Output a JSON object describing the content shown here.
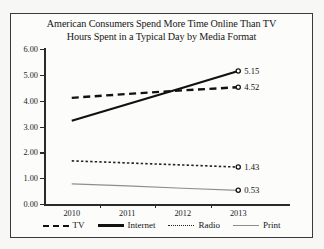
{
  "chart_data": {
    "type": "line",
    "title": "American Consumers Spend More Time Online Than TV",
    "subtitle": "Hours Spent in a Typical Day by Media Format",
    "xlabel": "",
    "ylabel": "",
    "categories": [
      "2010",
      "2011",
      "2012",
      "2013"
    ],
    "ylim": [
      0.0,
      6.0
    ],
    "ytick_labels": [
      "0.00",
      "1.00",
      "2.00",
      "3.00",
      "4.00",
      "5.00",
      "6.00"
    ],
    "ytick_values": [
      0.0,
      1.0,
      2.0,
      3.0,
      4.0,
      5.0,
      6.0
    ],
    "grid": false,
    "legend_position": "bottom",
    "series": [
      {
        "name": "TV",
        "style": "dashed",
        "color": "#111111",
        "values": [
          4.11,
          4.26,
          4.4,
          4.52
        ],
        "end_label": "4.52"
      },
      {
        "name": "Internet",
        "style": "solid-thick",
        "color": "#111111",
        "values": [
          3.22,
          3.86,
          4.5,
          5.15
        ],
        "end_label": "5.15"
      },
      {
        "name": "Radio",
        "style": "dotted",
        "color": "#222222",
        "values": [
          1.67,
          1.59,
          1.51,
          1.43
        ],
        "end_label": "1.43"
      },
      {
        "name": "Print",
        "style": "solid-thin",
        "color": "#8e8e8e",
        "values": [
          0.78,
          0.7,
          0.61,
          0.53
        ],
        "end_label": "0.53"
      }
    ]
  }
}
